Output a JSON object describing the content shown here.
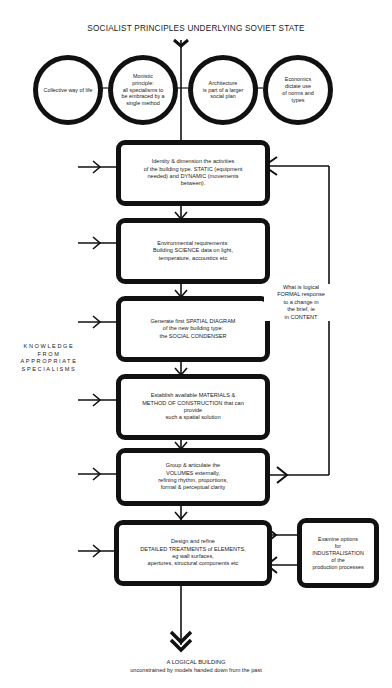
{
  "title": "SOCIALIST PRINCIPLES UNDERLYING SOVIET STATE",
  "principles": [
    {
      "label": "Collective\nway of life"
    },
    {
      "label": "Monistic\nprinciple:\nall specialisms to\nbe embraced by a\nsingle method"
    },
    {
      "label": "Architecture\nis part of a larger\nsocial plan"
    },
    {
      "label": "Economics\ndictate use\nof norms and\ntypes"
    }
  ],
  "steps": [
    {
      "label": "Identity & dimension the activities\nof the building type. STATIC (equipment\nneeded) and DYNAMIC (movements\nbetween)."
    },
    {
      "label": "Environmental requirements:\nBuilding SCIENCE data on light,\ntemperature, accoustics etc"
    },
    {
      "label": "Generate first SPATIAL DIAGRAM\nof the new building type:\nthe SOCIAL CONDENSER"
    },
    {
      "label": "Establish available MATERIALS &\nMETHOD OF CONSTRUCTION that can\nprovide\nsuch a spatial solution"
    },
    {
      "label": "Group & articulate the\nVOLUMES externally,\nrefining rhythm, proportions,\nformal & perceptual clarity"
    },
    {
      "label": "Design and refine\nDETAILED TREATMENTS of ELEMENTS,\neg wall surfaces,\napertures, structural components etc"
    }
  ],
  "side_box": {
    "label": "Examine options\nfor\nINDUSTRALISATION\nof the\nproduction processes"
  },
  "feedback_note": "What is logical\nFORMAL response\nto a change in\nthe brief, ie\nin CONTENT",
  "knowledge_label": "KNOWLEDGE\nFROM\nAPPROPRIATE\nSPECIALISMS",
  "outcome": {
    "title": "A LOGICAL BUILDING",
    "subtitle": "unconstrained by models handed down from the past"
  },
  "colors": {
    "stroke": "#111111",
    "background": "#ffffff",
    "text": "#222222"
  }
}
